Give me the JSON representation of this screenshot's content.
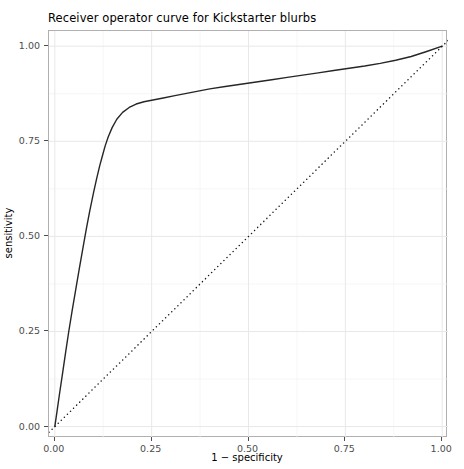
{
  "chart_data": {
    "type": "line",
    "title": "Receiver operator curve for Kickstarter blurbs",
    "xlabel": "1 − specificity",
    "ylabel": "sensitivity",
    "xlim": [
      -0.015,
      1.015
    ],
    "ylim": [
      -0.03,
      1.04
    ],
    "grid": true,
    "legend": "none",
    "xticks": [
      "0.00",
      "0.25",
      "0.50",
      "0.75",
      "1.00"
    ],
    "xtick_values": [
      0.0,
      0.25,
      0.5,
      0.75,
      1.0
    ],
    "yticks": [
      "0.00",
      "0.25",
      "0.50",
      "0.75",
      "1.00"
    ],
    "ytick_values": [
      0.0,
      0.25,
      0.5,
      0.75,
      1.0
    ],
    "series": [
      {
        "name": "ROC curve",
        "style": "solid",
        "color": "#262626",
        "width": 1.4,
        "x": [
          0.0,
          0.006,
          0.012,
          0.02,
          0.028,
          0.036,
          0.045,
          0.054,
          0.063,
          0.072,
          0.081,
          0.09,
          0.1,
          0.108,
          0.116,
          0.124,
          0.13,
          0.138,
          0.148,
          0.16,
          0.175,
          0.192,
          0.21,
          0.23,
          0.25,
          0.28,
          0.31,
          0.34,
          0.37,
          0.4,
          0.44,
          0.48,
          0.52,
          0.56,
          0.6,
          0.64,
          0.68,
          0.72,
          0.76,
          0.8,
          0.84,
          0.88,
          0.92,
          0.96,
          1.0
        ],
        "y": [
          0.0,
          0.042,
          0.085,
          0.14,
          0.196,
          0.25,
          0.306,
          0.36,
          0.414,
          0.466,
          0.518,
          0.566,
          0.615,
          0.652,
          0.686,
          0.716,
          0.738,
          0.762,
          0.786,
          0.808,
          0.826,
          0.839,
          0.848,
          0.854,
          0.858,
          0.864,
          0.87,
          0.876,
          0.882,
          0.888,
          0.894,
          0.9,
          0.906,
          0.912,
          0.918,
          0.924,
          0.93,
          0.936,
          0.942,
          0.948,
          0.955,
          0.963,
          0.973,
          0.986,
          1.0
        ]
      },
      {
        "name": "chance diagonal",
        "style": "dotted",
        "color": "#1a1a1a",
        "width": 1.4,
        "x": [
          -0.015,
          1.015
        ],
        "y": [
          -0.015,
          1.015
        ]
      }
    ]
  }
}
